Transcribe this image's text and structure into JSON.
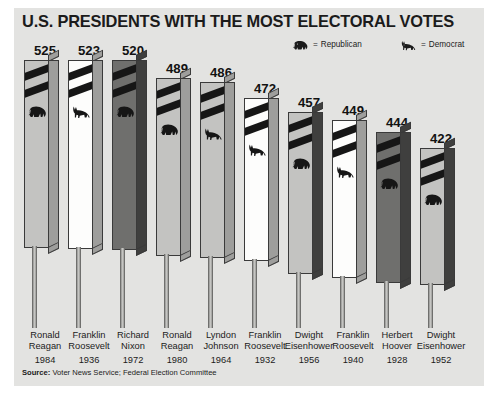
{
  "title": "U.S. PRESIDENTS WITH THE MOST ELECTORAL VOTES",
  "legend": {
    "equals": "=",
    "republican": {
      "label": "Republican",
      "icon": "elephant-icon"
    },
    "democrat": {
      "label": "Democrat",
      "icon": "donkey-icon"
    }
  },
  "source": {
    "prefix": "Source:",
    "text": "Voter News Service; Federal Election Committee"
  },
  "colors": {
    "panel": "#e3e3e1",
    "text": "#1b1b1b",
    "stripe": "#161616",
    "face_light": "#c3c3c1",
    "face_white": "#fdfdfc",
    "face_dark": "#6f6f6d",
    "side_light": "#9e9e9c",
    "side_dark": "#3f3f3e"
  },
  "chart_data": {
    "type": "bar",
    "title": "U.S. PRESIDENTS WITH THE MOST ELECTORAL VOTES",
    "xlabel": "",
    "ylabel": "Electoral Votes",
    "ylim": [
      0,
      538
    ],
    "grid": false,
    "legend_position": "top-right",
    "categories": [
      "Ronald Reagan 1984",
      "Franklin Roosevelt 1936",
      "Richard Nixon 1972",
      "Ronald Reagan 1980",
      "Lyndon Johnson 1964",
      "Franklin Roosevelt 1932",
      "Dwight Eisenhower 1956",
      "Franklin Roosevelt 1940",
      "Herbert Hoover 1928",
      "Dwight Eisenhower 1952"
    ],
    "values": [
      525,
      523,
      520,
      489,
      486,
      472,
      457,
      449,
      444,
      422
    ],
    "series": [
      {
        "name": "Electoral Votes",
        "values": [
          525,
          523,
          520,
          489,
          486,
          472,
          457,
          449,
          444,
          422
        ]
      }
    ],
    "bars": [
      {
        "value": "525",
        "first": "Ronald",
        "last": "Reagan",
        "year": "1984",
        "party": "republican",
        "icon": "elephant-icon",
        "face": "light",
        "side": "light"
      },
      {
        "value": "523",
        "first": "Franklin",
        "last": "Roosevelt",
        "year": "1936",
        "party": "democrat",
        "icon": "donkey-icon",
        "face": "white",
        "side": "light"
      },
      {
        "value": "520",
        "first": "Richard",
        "last": "Nixon",
        "year": "1972",
        "party": "republican",
        "icon": "elephant-icon",
        "face": "dark",
        "side": "dark"
      },
      {
        "value": "489",
        "first": "Ronald",
        "last": "Reagan",
        "year": "1980",
        "party": "republican",
        "icon": "elephant-icon",
        "face": "light",
        "side": "light"
      },
      {
        "value": "486",
        "first": "Lyndon",
        "last": "Johnson",
        "year": "1964",
        "party": "democrat",
        "icon": "donkey-icon",
        "face": "light",
        "side": "light"
      },
      {
        "value": "472",
        "first": "Franklin",
        "last": "Roosevelt",
        "year": "1932",
        "party": "democrat",
        "icon": "donkey-icon",
        "face": "white",
        "side": "light"
      },
      {
        "value": "457",
        "first": "Dwight",
        "last": "Eisenhower",
        "year": "1956",
        "party": "republican",
        "icon": "elephant-icon",
        "face": "light",
        "side": "dark"
      },
      {
        "value": "449",
        "first": "Franklin",
        "last": "Roosevelt",
        "year": "1940",
        "party": "democrat",
        "icon": "donkey-icon",
        "face": "white",
        "side": "light"
      },
      {
        "value": "444",
        "first": "Herbert",
        "last": "Hoover",
        "year": "1928",
        "party": "republican",
        "icon": "elephant-icon",
        "face": "dark",
        "side": "dark"
      },
      {
        "value": "422",
        "first": "Dwight",
        "last": "Eisenhower",
        "year": "1952",
        "party": "republican",
        "icon": "elephant-icon",
        "face": "light",
        "side": "dark"
      }
    ]
  }
}
